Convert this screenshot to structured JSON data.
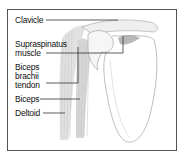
{
  "diagram": {
    "title": "",
    "labels": [
      {
        "id": "clavicle",
        "lines": [
          "Clavicle"
        ]
      },
      {
        "id": "supraspinatus",
        "lines": [
          "Supraspinatus",
          "muscle"
        ]
      },
      {
        "id": "biceps-tendon",
        "lines": [
          "Biceps",
          "brachii",
          "tendon"
        ]
      },
      {
        "id": "biceps",
        "lines": [
          "Biceps"
        ]
      },
      {
        "id": "deltoid",
        "lines": [
          "Deltoid"
        ]
      }
    ],
    "colors": {
      "frame": "#555555",
      "leader": "#333333",
      "bone_outline": "#b0b0b0",
      "muscle_fill": "#d6d6d6"
    }
  }
}
